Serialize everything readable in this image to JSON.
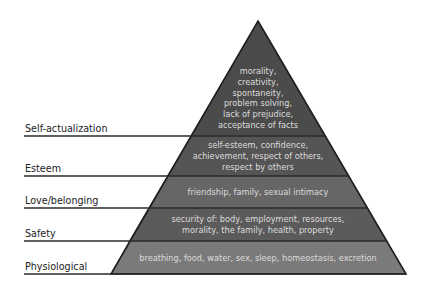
{
  "diagram": {
    "colors": {
      "outline": "#1e1e1e",
      "label_line": "#2a2a2a",
      "text_inside": "#dcdcdc",
      "label_text": "#222222"
    },
    "levels": [
      {
        "name": "Self-actualization",
        "fill": "#4b4b4b",
        "lines": [
          "morality,",
          "creativity,",
          "spontaneity,",
          "problem solving,",
          "lack of prejudice,",
          "acceptance of facts"
        ]
      },
      {
        "name": "Esteem",
        "fill": "#555555",
        "lines": [
          "self-esteem, confidence,",
          "achievement, respect of others,",
          "respect by others"
        ]
      },
      {
        "name": "Love/belonging",
        "fill": "#666666",
        "lines": [
          "friendship, family, sexual intimacy"
        ]
      },
      {
        "name": "Safety",
        "fill": "#5b5b5b",
        "lines": [
          "security of: body, employment, resources,",
          "morality, the family, health, property"
        ]
      },
      {
        "name": "Physiological",
        "fill": "#7a7a7a",
        "lines": [
          "breathing, food, water, sex, sleep, homeostasis, excretion"
        ]
      }
    ]
  }
}
